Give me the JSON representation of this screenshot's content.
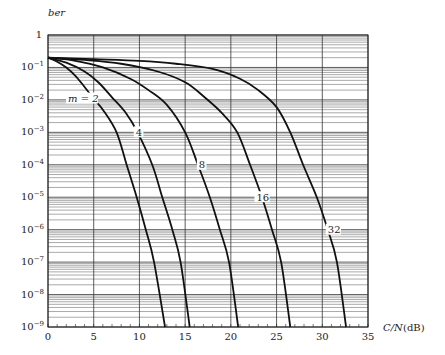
{
  "chart_data": {
    "type": "line",
    "title": "",
    "xlabel": "C/N (dB)",
    "xlabel_italic_part": "C/N",
    "xlabel_unit": "(dB)",
    "ylabel": "ber",
    "xlim": [
      0,
      35
    ],
    "ylim": [
      1e-09,
      1
    ],
    "yscale": "log",
    "grid": true,
    "x_ticks": [
      0,
      5,
      10,
      15,
      20,
      25,
      30,
      35
    ],
    "x_tick_labels": [
      "0",
      "5",
      "10",
      "15",
      "20",
      "25",
      "30",
      "35"
    ],
    "y_tick_labels": [
      {
        "mant": "1",
        "exp": ""
      },
      {
        "mant": "10",
        "exp": "−1"
      },
      {
        "mant": "10",
        "exp": "−2"
      },
      {
        "mant": "10",
        "exp": "−3"
      },
      {
        "mant": "10",
        "exp": "−4"
      },
      {
        "mant": "10",
        "exp": "−5"
      },
      {
        "mant": "10",
        "exp": "−6"
      },
      {
        "mant": "10",
        "exp": "−7"
      },
      {
        "mant": "10",
        "exp": "−8"
      },
      {
        "mant": "10",
        "exp": "−9"
      }
    ],
    "series": [
      {
        "name": "m = 2",
        "label": "m = 2",
        "label_at": [
          2.2,
          0.011
        ],
        "x": [
          0,
          1,
          2,
          3,
          4,
          5.1,
          6,
          7.5,
          8.6,
          9.7,
          10.7,
          11.6,
          12.8
        ],
        "y": [
          0.2,
          0.15,
          0.1,
          0.055,
          0.025,
          0.01,
          0.005,
          0.001,
          0.0001,
          1e-05,
          1e-06,
          1e-07,
          1e-09
        ]
      },
      {
        "name": "m = 4",
        "label": "4",
        "label_at": [
          9.6,
          0.001
        ],
        "x": [
          0,
          2,
          4,
          5.5,
          7,
          8.5,
          9.8,
          11.4,
          12.5,
          13.6,
          14.5,
          15.5
        ],
        "y": [
          0.2,
          0.14,
          0.075,
          0.035,
          0.012,
          0.004,
          0.001,
          0.0001,
          1e-05,
          1e-06,
          1e-07,
          1e-09
        ]
      },
      {
        "name": "m = 8",
        "label": "8",
        "label_at": [
          16.5,
          0.0001
        ],
        "x": [
          0,
          3,
          6,
          9,
          11,
          13,
          15,
          16.4,
          17.7,
          18.8,
          19.8,
          20.8
        ],
        "y": [
          0.2,
          0.16,
          0.1,
          0.045,
          0.02,
          0.007,
          0.001,
          0.0001,
          1e-05,
          1e-06,
          1e-07,
          1e-09
        ]
      },
      {
        "name": "m = 16",
        "label": "16",
        "label_at": [
          22.8,
          1e-05
        ],
        "x": [
          0,
          4,
          8,
          12,
          15,
          17,
          19,
          20.7,
          22.1,
          23.4,
          24.5,
          25.5,
          26.5
        ],
        "y": [
          0.2,
          0.17,
          0.13,
          0.075,
          0.035,
          0.013,
          0.004,
          0.001,
          0.0001,
          1e-05,
          1e-06,
          1e-07,
          1e-09
        ]
      },
      {
        "name": "m = 32",
        "label": "32",
        "label_at": [
          30.6,
          1e-06
        ],
        "x": [
          0,
          5,
          10,
          14,
          18,
          21,
          23,
          25,
          26.5,
          27.9,
          29.4,
          30.6,
          31.6,
          32.6
        ],
        "y": [
          0.2,
          0.18,
          0.16,
          0.13,
          0.09,
          0.045,
          0.02,
          0.006,
          0.001,
          0.0001,
          1e-05,
          1e-06,
          1e-07,
          1e-09
        ]
      }
    ]
  }
}
